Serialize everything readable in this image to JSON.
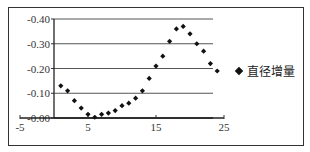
{
  "chart_data": {
    "type": "scatter",
    "title": "",
    "xlabel": "",
    "ylabel": "",
    "xlim": [
      -5,
      25
    ],
    "ylim": [
      0.0,
      -0.4
    ],
    "x_ticks": [
      "-5",
      "5",
      "15",
      "25"
    ],
    "y_ticks": [
      "-0.40",
      "-0.30",
      "-0.20",
      "-0.10",
      "-0.00"
    ],
    "grid": "horizontal",
    "legend_position": "right",
    "series": [
      {
        "name": "直径增量",
        "marker": "diamond",
        "color": "#111111",
        "x": [
          1,
          2,
          3,
          4,
          5,
          6,
          7,
          8,
          9,
          10,
          11,
          12,
          13,
          14,
          15,
          16,
          17,
          18,
          19,
          20,
          21,
          22,
          23,
          24
        ],
        "values": [
          -0.13,
          -0.11,
          -0.07,
          -0.04,
          -0.015,
          -0.003,
          -0.015,
          -0.02,
          -0.03,
          -0.05,
          -0.06,
          -0.08,
          -0.11,
          -0.16,
          -0.21,
          -0.25,
          -0.31,
          -0.36,
          -0.37,
          -0.34,
          -0.3,
          -0.27,
          -0.22,
          -0.19
        ]
      }
    ]
  },
  "legend": {
    "label": "直径增量"
  }
}
